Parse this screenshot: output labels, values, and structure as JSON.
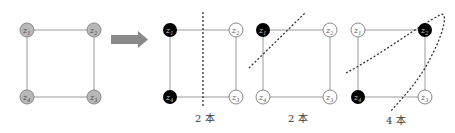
{
  "colors": {
    "edge": "#9a9a9a",
    "node_gray_fill": "#b8b8b8",
    "node_black_fill": "#000000",
    "node_white_fill": "#ffffff",
    "arrow": "#8a8a8a",
    "cut": "#333333"
  },
  "graphs": [
    {
      "name": "original",
      "nodes": [
        {
          "label": "z",
          "sub": "1",
          "state": "gray"
        },
        {
          "label": "z",
          "sub": "2",
          "state": "gray"
        },
        {
          "label": "z",
          "sub": "4",
          "state": "gray"
        },
        {
          "label": "z",
          "sub": "3",
          "state": "gray"
        }
      ]
    },
    {
      "name": "cut-a",
      "nodes": [
        {
          "label": "z",
          "sub": "1",
          "state": "black"
        },
        {
          "label": "z",
          "sub": "2",
          "state": "white"
        },
        {
          "label": "z",
          "sub": "4",
          "state": "black"
        },
        {
          "label": "z",
          "sub": "3",
          "state": "white"
        }
      ],
      "caption": "2 本"
    },
    {
      "name": "cut-b",
      "nodes": [
        {
          "label": "z",
          "sub": "1",
          "state": "black"
        },
        {
          "label": "z",
          "sub": "2",
          "state": "white"
        },
        {
          "label": "z",
          "sub": "4",
          "state": "white"
        },
        {
          "label": "z",
          "sub": "3",
          "state": "white"
        }
      ],
      "caption": "2 本"
    },
    {
      "name": "cut-c",
      "nodes": [
        {
          "label": "z",
          "sub": "1",
          "state": "white"
        },
        {
          "label": "z",
          "sub": "2",
          "state": "black"
        },
        {
          "label": "z",
          "sub": "4",
          "state": "black"
        },
        {
          "label": "z",
          "sub": "3",
          "state": "white"
        }
      ],
      "caption": "4 本"
    }
  ],
  "arrow": {
    "icon": "right-arrow-icon"
  }
}
